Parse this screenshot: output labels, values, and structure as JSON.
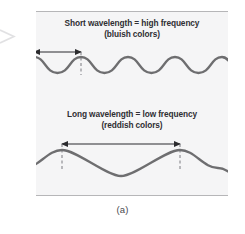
{
  "figure": {
    "caption": "(a)",
    "panel_background": "#f5f5f6",
    "rule_color": "#b6b6b8",
    "wave_color": "#6e6e70",
    "arrow_color": "#2b2b2e",
    "text_color": "#2f2f33",
    "blocks": [
      {
        "id": "short-wavelength",
        "title": "Short wavelength = high frequency",
        "subtitle": "(bluish colors)",
        "wave": {
          "type": "sine",
          "cycles": 4,
          "amplitude": 11,
          "description": "short wavelength high frequency wave"
        },
        "measure": {
          "label": "wavelength",
          "style": "double-headed-arrow",
          "from_marker": "first-crest",
          "to_marker": "second-crest"
        }
      },
      {
        "id": "long-wavelength",
        "title": "Long wavelength = low frequency",
        "subtitle": "(reddish colors)",
        "wave": {
          "type": "sine",
          "cycles": 1.5,
          "amplitude": 13,
          "description": "long wavelength low frequency wave"
        },
        "measure": {
          "label": "wavelength",
          "style": "double-headed-arrow",
          "from_marker": "first-crest",
          "to_marker": "second-crest"
        }
      }
    ]
  }
}
